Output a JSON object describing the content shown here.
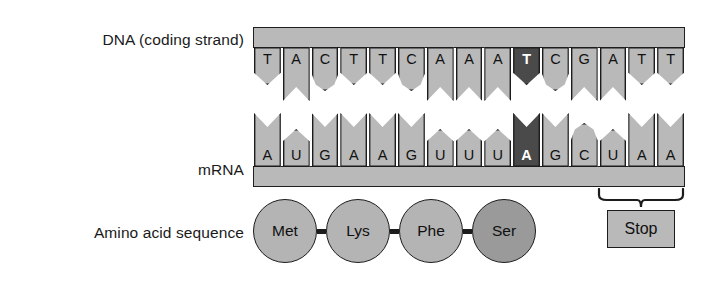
{
  "labels": {
    "dna": "DNA (coding strand)",
    "mrna": "mRNA",
    "amino_acid": "Amino acid sequence"
  },
  "dna": {
    "bases": [
      {
        "letter": "T",
        "shape": "point",
        "highlight": false
      },
      {
        "letter": "A",
        "shape": "notch",
        "highlight": false
      },
      {
        "letter": "C",
        "shape": "round",
        "highlight": false
      },
      {
        "letter": "T",
        "shape": "point",
        "highlight": false
      },
      {
        "letter": "T",
        "shape": "point",
        "highlight": false
      },
      {
        "letter": "C",
        "shape": "round",
        "highlight": false
      },
      {
        "letter": "A",
        "shape": "notch",
        "highlight": false
      },
      {
        "letter": "A",
        "shape": "notch",
        "highlight": false
      },
      {
        "letter": "A",
        "shape": "notch",
        "highlight": false
      },
      {
        "letter": "T",
        "shape": "point",
        "highlight": true
      },
      {
        "letter": "C",
        "shape": "round",
        "highlight": false
      },
      {
        "letter": "G",
        "shape": "notch",
        "highlight": false
      },
      {
        "letter": "A",
        "shape": "notch",
        "highlight": false
      },
      {
        "letter": "T",
        "shape": "point",
        "highlight": false
      },
      {
        "letter": "T",
        "shape": "point",
        "highlight": false
      }
    ],
    "sequence": "TACTTCAAATCGATT"
  },
  "mrna": {
    "bases": [
      {
        "letter": "A",
        "shape": "notch",
        "highlight": false
      },
      {
        "letter": "U",
        "shape": "point",
        "highlight": false
      },
      {
        "letter": "G",
        "shape": "notch",
        "highlight": false
      },
      {
        "letter": "A",
        "shape": "notch",
        "highlight": false
      },
      {
        "letter": "A",
        "shape": "notch",
        "highlight": false
      },
      {
        "letter": "G",
        "shape": "notch",
        "highlight": false
      },
      {
        "letter": "U",
        "shape": "point",
        "highlight": false
      },
      {
        "letter": "U",
        "shape": "point",
        "highlight": false
      },
      {
        "letter": "U",
        "shape": "point",
        "highlight": false
      },
      {
        "letter": "A",
        "shape": "notch",
        "highlight": true
      },
      {
        "letter": "G",
        "shape": "notch",
        "highlight": false
      },
      {
        "letter": "C",
        "shape": "round",
        "highlight": false
      },
      {
        "letter": "U",
        "shape": "point",
        "highlight": false
      },
      {
        "letter": "A",
        "shape": "notch",
        "highlight": false
      },
      {
        "letter": "A",
        "shape": "notch",
        "highlight": false
      }
    ],
    "sequence": "AUGAAGUUUAGCUAA"
  },
  "amino_acids": [
    {
      "name": "Met",
      "highlight": false
    },
    {
      "name": "Lys",
      "highlight": false
    },
    {
      "name": "Phe",
      "highlight": false
    },
    {
      "name": "Ser",
      "highlight": true
    }
  ],
  "stop": {
    "label": "Stop"
  },
  "colors": {
    "base_fill": "#b9b9b9",
    "base_highlight": "#4a4a4a",
    "amino_fill": "#b4b4b4",
    "amino_highlight": "#9a9a9a",
    "outline": "#1c1c1c",
    "background": "#ffffff"
  }
}
